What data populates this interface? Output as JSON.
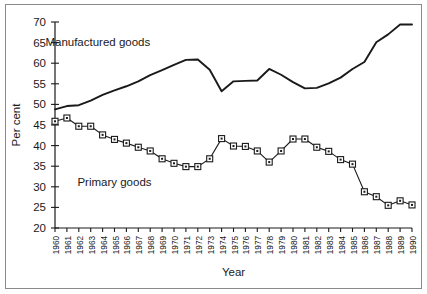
{
  "figure": {
    "background_color": "#ffffff",
    "frame_color": "#8a8a8a",
    "line_color": "#1a1a1a"
  },
  "chart_data": {
    "type": "line",
    "title": "",
    "xlabel": "Year",
    "ylabel": "Per cent",
    "xlim": [
      1960,
      1990
    ],
    "ylim": [
      20,
      70
    ],
    "yticks": [
      20,
      25,
      30,
      35,
      40,
      45,
      50,
      55,
      60,
      65,
      70
    ],
    "ytick_labels": [
      "20",
      "25",
      "30",
      "35",
      "40",
      "45",
      "50",
      "55",
      "60",
      "65",
      "70"
    ],
    "grid": false,
    "legend_position": "inline-annotation",
    "x": [
      1960,
      1961,
      1962,
      1963,
      1964,
      1965,
      1966,
      1967,
      1968,
      1969,
      1970,
      1971,
      1972,
      1973,
      1974,
      1975,
      1976,
      1977,
      1978,
      1979,
      1980,
      1981,
      1982,
      1983,
      1984,
      1985,
      1986,
      1987,
      1988,
      1989,
      1990
    ],
    "xtick_labels": [
      "1960",
      "1961",
      "1962",
      "1963",
      "1964",
      "1965",
      "1966",
      "1967",
      "1968",
      "1969",
      "1970",
      "1971",
      "1972",
      "1973",
      "1974",
      "1975",
      "1976",
      "1977",
      "1978",
      "1979",
      "1980",
      "1981",
      "1982",
      "1983",
      "1984",
      "1985",
      "1986",
      "1987",
      "1988",
      "1989",
      "1990"
    ],
    "series": [
      {
        "name": "Manufactured goods",
        "marker": "none",
        "label_x": 1963.6,
        "label_y": 64.2,
        "values": [
          48.8,
          49.6,
          49.8,
          50.9,
          52.3,
          53.4,
          54.4,
          55.6,
          57.1,
          58.3,
          59.6,
          60.8,
          60.9,
          58.4,
          53.2,
          55.6,
          55.7,
          55.8,
          58.6,
          57.2,
          55.4,
          53.9,
          54.0,
          55.1,
          56.5,
          58.6,
          60.3,
          65.1,
          67.0,
          69.4,
          69.4
        ]
      },
      {
        "name": "Primary goods",
        "marker": "square",
        "label_x": 1965.0,
        "label_y": 30.1,
        "values": [
          45.9,
          46.7,
          44.7,
          44.7,
          42.6,
          41.5,
          40.6,
          39.6,
          38.7,
          36.8,
          35.7,
          34.9,
          34.9,
          36.8,
          41.7,
          39.9,
          39.8,
          38.7,
          36.0,
          38.7,
          41.6,
          41.6,
          39.6,
          38.6,
          36.6,
          35.5,
          28.8,
          27.6,
          25.5,
          26.6,
          25.6
        ]
      }
    ]
  }
}
